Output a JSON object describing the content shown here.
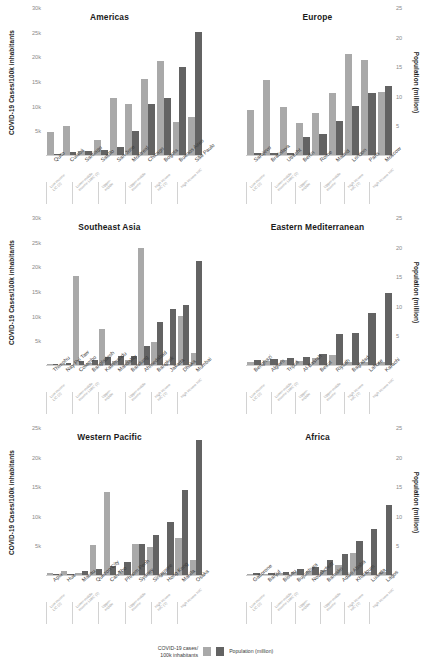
{
  "axes": {
    "left_label": "COVID-19 Cases/100k inhabitants",
    "right_label": "Population (million)",
    "left_ticks": [
      "30k",
      "25k",
      "20k",
      "15k",
      "10k",
      "5k"
    ],
    "left_tick_values": [
      30000,
      25000,
      20000,
      15000,
      10000,
      5000
    ],
    "right_ticks": [
      "25",
      "20",
      "15",
      "10",
      "5"
    ],
    "right_tick_values": [
      25,
      20,
      15,
      10,
      5
    ],
    "left_max": 30000,
    "right_max": 25
  },
  "legend": {
    "cases_label": "COVID-19 cases/\n100k inhabitants",
    "population_label": "Population (million)",
    "cases_color": "#a9a9a9",
    "population_color": "#636363"
  },
  "income_groups": [
    "Low income\nLIC (2)",
    "Lower-middle\nincome LMIC (2)",
    "Upper-\nmiddle",
    "Upper-middle\nincome",
    "High income\nHIC (2)",
    "High income HIC"
  ],
  "chart_data": [
    {
      "type": "bar",
      "title": "Americas",
      "xlabel": "",
      "ylabel": "COVID-19 Cases/100k inhabitants",
      "ylim": [
        0,
        30000
      ],
      "y2lim": [
        0,
        25
      ],
      "grid": false,
      "categories": [
        "Quito",
        "Cuiabá",
        "Santiago",
        "Saltillo",
        "San Jose",
        "Montreal",
        "Chicago",
        "Bogota",
        "Buenos Aires",
        "São Paulo"
      ],
      "series": [
        {
          "name": "COVID-19 cases/100k inhabitants",
          "axis": "left",
          "values": [
            4700,
            5900,
            900,
            3000,
            11500,
            10400,
            15500,
            19100,
            6800,
            7700
          ]
        },
        {
          "name": "Population (million)",
          "axis": "right",
          "values": [
            0.2,
            0.5,
            0.7,
            0.9,
            1.4,
            4.0,
            8.6,
            9.6,
            14.8,
            20.8
          ]
        }
      ]
    },
    {
      "type": "bar",
      "title": "Europe",
      "xlabel": "",
      "ylabel": "COVID-19 Cases/100k inhabitants",
      "ylim": [
        0,
        30000
      ],
      "y2lim": [
        0,
        25
      ],
      "grid": false,
      "categories": [
        "Sarajevo",
        "Bratislava",
        "Utrecht",
        "Berlin",
        "Rome",
        "Madrid",
        "London",
        "Paris",
        "Moscow"
      ],
      "series": [
        {
          "name": "COVID-19 cases/100k inhabitants",
          "axis": "left",
          "values": [
            9100,
            15200,
            9800,
            6500,
            8500,
            12500,
            20500,
            19300,
            12800
          ]
        },
        {
          "name": "Population (million)",
          "axis": "right",
          "values": [
            0.3,
            0.4,
            0.35,
            3.0,
            3.6,
            5.7,
            8.3,
            10.4,
            11.6
          ]
        }
      ]
    },
    {
      "type": "bar",
      "title": "Southeast Asia",
      "xlabel": "",
      "ylabel": "COVID-19 Cases/100k inhabitants",
      "ylim": [
        0,
        30000
      ],
      "y2lim": [
        0,
        25
      ],
      "grid": false,
      "categories": [
        "Thimphu",
        "Nay Pyi Taw",
        "Colombo",
        "Bangladesh",
        "Kathmandu",
        "Mandalay",
        "Bandung",
        "Ahmedabad",
        "Bangkok",
        "Jakarta",
        "Dhaka",
        "Mumbai"
      ],
      "series": [
        {
          "name": "COVID-19 cases/100k inhabitants",
          "axis": "left",
          "values": [
            200,
            300,
            18100,
            400,
            7300,
            900,
            1000,
            23800,
            4700,
            300,
            10000,
            2500,
            5400
          ]
        },
        {
          "name": "Population (million)",
          "axis": "right",
          "values": [
            0.1,
            0.4,
            0.6,
            0.8,
            1.4,
            1.5,
            1.6,
            3.2,
            7.3,
            9.4,
            10.2,
            17.5,
            19.4
          ]
        }
      ]
    },
    {
      "type": "bar",
      "title": "Eastern Mediterranean",
      "xlabel": "",
      "ylabel": "COVID-19 Cases/100k inhabitants",
      "ylim": [
        0,
        30000
      ],
      "y2lim": [
        0,
        25
      ],
      "grid": false,
      "categories": [
        "Benghazi",
        "Algiers",
        "Tripoli",
        "Al-Basrah",
        "Beirut",
        "Riyadh",
        "Baghdad",
        "Lahore",
        "Karachi"
      ],
      "series": [
        {
          "name": "COVID-19 cases/100k inhabitants",
          "axis": "left",
          "values": [
            700,
            900,
            1000,
            800,
            1500,
            2100,
            700,
            600,
            600
          ]
        },
        {
          "name": "Population (million)",
          "axis": "right",
          "values": [
            0.9,
            1.1,
            1.2,
            1.3,
            1.9,
            5.3,
            5.4,
            8.8,
            12.2
          ]
        }
      ]
    },
    {
      "type": "bar",
      "title": "Western Pacific",
      "xlabel": "",
      "ylabel": "COVID-19 Cases/100k inhabitants",
      "ylim": [
        0,
        25000
      ],
      "y2lim": [
        0,
        25
      ],
      "grid": false,
      "categories": [
        "Apia",
        "Hue",
        "Macau",
        "Quezon City",
        "Can Tho",
        "Phnom Penh",
        "Sydney",
        "Singapore",
        "Hong Kong",
        "Manila",
        "Osaka"
      ],
      "series": [
        {
          "name": "COVID-19 cases/100k inhabitants",
          "axis": "left",
          "values": [
            400,
            600,
            300,
            5000,
            14100,
            600,
            5200,
            4800,
            300,
            6200,
            2600
          ]
        },
        {
          "name": "Population (million)",
          "axis": "right",
          "values": [
            0.05,
            0.1,
            0.6,
            1.0,
            1.6,
            2.2,
            5.3,
            6.8,
            9.0,
            14.4,
            22.8
          ]
        }
      ]
    },
    {
      "type": "bar",
      "title": "Africa",
      "xlabel": "",
      "ylabel": "COVID-19 Cases/100k inhabitants",
      "ylim": [
        0,
        30000
      ],
      "y2lim": [
        0,
        25
      ],
      "grid": false,
      "categories": [
        "Gaborone",
        "Banjul",
        "Bissau",
        "Bujumbura",
        "Nouakchott",
        "Bamako",
        "Addis Ababa",
        "Khartoum",
        "Luanda",
        "Lagos"
      ],
      "series": [
        {
          "name": "COVID-19 cases/100k inhabitants",
          "axis": "left",
          "values": [
            200,
            300,
            400,
            600,
            900,
            1000,
            2000,
            4500,
            700,
            700
          ]
        },
        {
          "name": "Population (million)",
          "axis": "right",
          "values": [
            0.3,
            0.4,
            0.5,
            1.0,
            1.3,
            2.6,
            3.5,
            5.8,
            7.8,
            11.8
          ]
        }
      ]
    }
  ]
}
